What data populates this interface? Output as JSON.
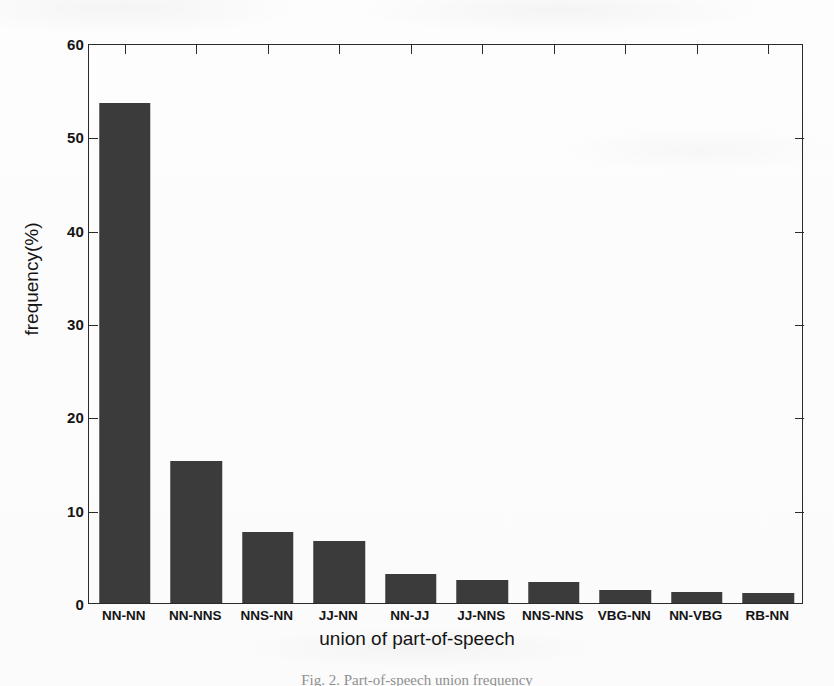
{
  "figure": {
    "caption": "Fig. 2.  Part-of-speech union frequency",
    "background_color": "#ffffff",
    "bar_color": "#3b3b3b",
    "axis_color": "#2b2b2b"
  },
  "chart_data": {
    "type": "bar",
    "title": "",
    "xlabel": "union of part-of-speech",
    "ylabel": "frequency(%)",
    "categories": [
      "NN-NN",
      "NN-NNS",
      "NNS-NN",
      "JJ-NN",
      "NN-JJ",
      "JJ-NNS",
      "NNS-NNS",
      "VBG-NN",
      "NN-VBG",
      "RB-NN"
    ],
    "values": [
      53.6,
      15.2,
      7.6,
      6.6,
      3.1,
      2.5,
      2.2,
      1.4,
      1.2,
      1.1
    ],
    "ylim": [
      0,
      60
    ],
    "ytick_labels": [
      "0",
      "10",
      "20",
      "30",
      "40",
      "50",
      "60"
    ],
    "ytick_values": [
      0,
      10,
      20,
      30,
      40,
      50,
      60
    ],
    "grid": false,
    "legend": null
  }
}
